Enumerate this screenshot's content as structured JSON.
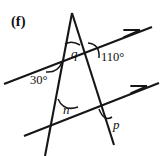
{
  "figure": {
    "panel_label": "(f)",
    "background_color": "#ffffff",
    "stroke_color": "#161616",
    "width": 165,
    "height": 156,
    "angle_labels": [
      {
        "name": "q",
        "text": "q",
        "kind": "variable",
        "x": 71,
        "y": 47,
        "location": "apex-angle-between-two-transversal-lines"
      },
      {
        "name": "110",
        "text": "110°",
        "kind": "degrees",
        "x": 101,
        "y": 51,
        "location": "right-line-meets-upper-parallel"
      },
      {
        "name": "30",
        "text": "30°",
        "kind": "degrees",
        "x": 30,
        "y": 74,
        "location": "left-line-meets-upper-parallel"
      },
      {
        "name": "n",
        "text": "n",
        "kind": "variable",
        "x": 63,
        "y": 103,
        "location": "left-line-meets-lower-parallel"
      },
      {
        "name": "p",
        "text": "p",
        "kind": "variable",
        "x": 113,
        "y": 118,
        "location": "right-line-meets-lower-parallel"
      }
    ],
    "parallel_marks": [
      {
        "name": "upper-parallel-arrow",
        "count": 1
      },
      {
        "name": "lower-parallel-arrow",
        "count": 1
      }
    ]
  }
}
